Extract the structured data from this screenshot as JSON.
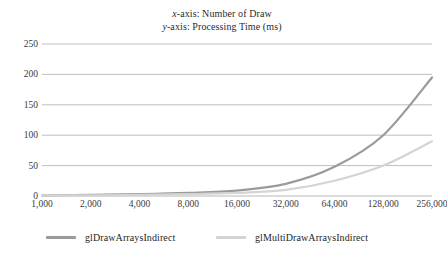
{
  "chart_data": {
    "type": "line",
    "title_lines": [
      {
        "var": "x",
        "rest": "-axis: Number of Draw"
      },
      {
        "var": "y",
        "rest": "-axis: Processing Time (ms)"
      }
    ],
    "xlabel": "Number of Draw",
    "ylabel": "Processing Time (ms)",
    "categories": [
      "1,000",
      "2,000",
      "4,000",
      "8,000",
      "16,000",
      "32,000",
      "64,000",
      "128,000",
      "256,000"
    ],
    "yticks": [
      "0",
      "50",
      "100",
      "150",
      "200",
      "250"
    ],
    "ytick_values": [
      0,
      50,
      100,
      150,
      200,
      250
    ],
    "ylim": [
      0,
      250
    ],
    "grid": true,
    "legend_position": "bottom",
    "series": [
      {
        "name": "glDrawArraysIndirect",
        "color": "#9a9a9a",
        "values": [
          1,
          2,
          3,
          5,
          9,
          20,
          48,
          100,
          195
        ]
      },
      {
        "name": "glMultiDrawArraysIndirect",
        "color": "#d4d4d4",
        "values": [
          1,
          1,
          2,
          3,
          5,
          10,
          25,
          50,
          90
        ]
      }
    ]
  },
  "colors": {
    "gridline": "#b8b8b8",
    "axis_text": "#3a3a3a",
    "background": "#ffffff"
  }
}
